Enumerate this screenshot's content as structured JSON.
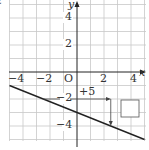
{
  "problem_marker": "2",
  "graph": {
    "origin_label": "O",
    "x_axis_label": "x",
    "y_axis_label": "y",
    "x_ticks": [
      {
        "value": -4,
        "label": "−4"
      },
      {
        "value": -2,
        "label": "−2"
      },
      {
        "value": 2,
        "label": "2"
      },
      {
        "value": 4,
        "label": "4"
      }
    ],
    "y_ticks": [
      {
        "value": 4,
        "label": "4"
      },
      {
        "value": 2,
        "label": "2"
      },
      {
        "value": -2,
        "label": "−2"
      },
      {
        "value": -4,
        "label": "−4"
      }
    ],
    "line": {
      "slope": -0.4,
      "intercept": -3,
      "x_from": -5.5,
      "x_to": 5
    },
    "horizontal_step_label": "+5",
    "horizontal_step": {
      "from": [
        -2.5,
        -2
      ],
      "to": [
        2.5,
        -2
      ]
    },
    "vertical_step": {
      "from": [
        2.5,
        -2
      ],
      "to": [
        2.5,
        -4
      ]
    },
    "answer_box": ""
  },
  "colors": {
    "grid": "#c8c8c8",
    "axis": "#222222",
    "line": "#222222",
    "text": "#333333"
  }
}
